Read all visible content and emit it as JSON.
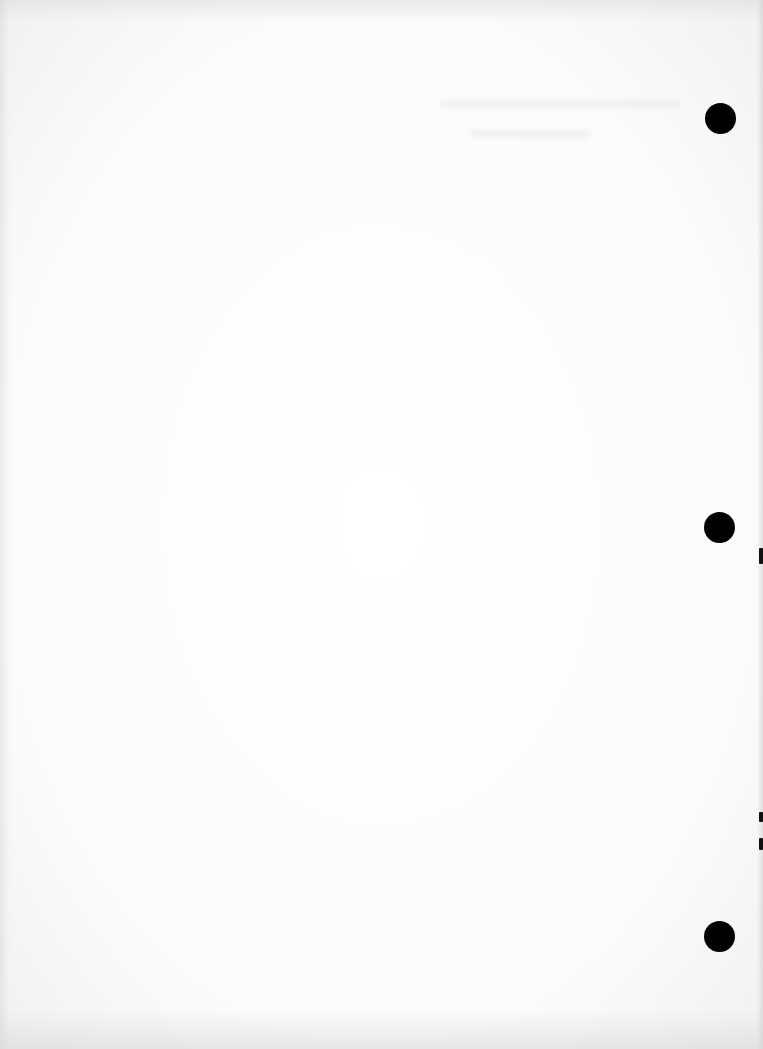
{
  "document": {
    "type": "scanned-blank-page",
    "background_color": "#ffffff",
    "text_content": ""
  },
  "punch_holes": [
    {
      "cx": 721,
      "cy": 119,
      "diameter": 31,
      "color": "#000000"
    },
    {
      "cx": 720,
      "cy": 528,
      "diameter": 31,
      "color": "#000000"
    },
    {
      "cx": 720,
      "cy": 937,
      "diameter": 31,
      "color": "#000000"
    }
  ],
  "edge_marks": [
    {
      "top": 548,
      "height": 16
    },
    {
      "top": 812,
      "height": 10
    },
    {
      "top": 838,
      "height": 12
    }
  ]
}
